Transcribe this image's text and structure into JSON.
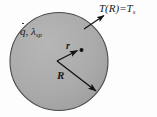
{
  "figure": {
    "background_color": "#fdfdfd",
    "sphere": {
      "name": "solid-sphere",
      "fill_color": "#a9a9a9",
      "stroke_color": "#3c3c3c",
      "center_x": 59,
      "center_y": 61,
      "radius_px": 49
    },
    "labels": {
      "surface_temp": {
        "main": "T(R)=T",
        "subscript": "s",
        "meaning": "surface-temperature-boundary-condition"
      },
      "source_props": {
        "generation": "q",
        "comma": ", ",
        "conductivity": "λ",
        "conductivity_subscript": "sp",
        "meaning": "volumetric-heat-generation-and-thermal-conductivity"
      },
      "radius_variable": "r",
      "radius_outer": "R"
    },
    "leaders": {
      "surface_leader": {
        "name": "surface-temp-leader-arrow",
        "from_x": 84,
        "from_y": 29,
        "to_x": 105,
        "to_y": 15
      },
      "r_arrow": {
        "name": "radial-coordinate-arrow",
        "from_x": 57,
        "from_y": 61,
        "to_x": 79,
        "to_y": 50
      },
      "R_arrow": {
        "name": "outer-radius-arrow",
        "from_x": 57,
        "from_y": 61,
        "to_x": 97,
        "to_y": 92
      },
      "point_marker": {
        "name": "field-point-dot",
        "x": 81,
        "y": 50,
        "r": 2
      }
    }
  }
}
